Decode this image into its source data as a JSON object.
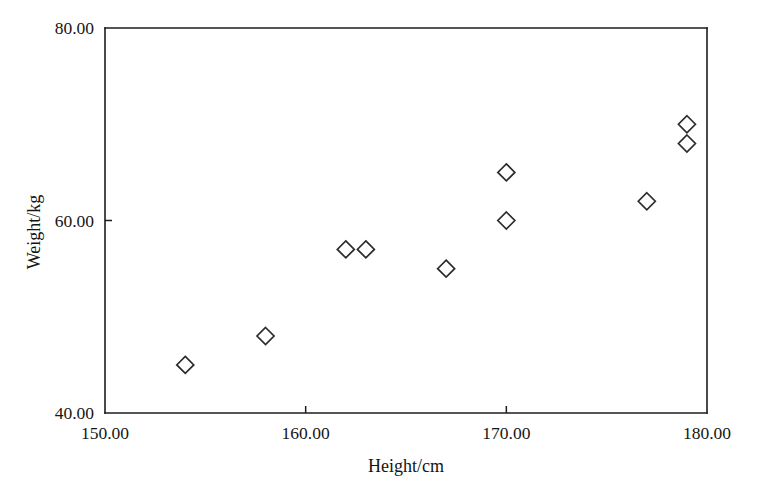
{
  "chart_data": {
    "type": "scatter",
    "title": "",
    "xlabel": "Height/cm",
    "ylabel": "Weight/kg",
    "xlim": [
      150.0,
      180.0
    ],
    "ylim": [
      40.0,
      80.0
    ],
    "xticks": [
      150.0,
      160.0,
      170.0,
      180.0
    ],
    "yticks": [
      40.0,
      60.0,
      80.0
    ],
    "xticklabels": [
      "150.00",
      "160.00",
      "170.00",
      "180.00"
    ],
    "yticklabels": [
      "40.00",
      "60.00",
      "80.00"
    ],
    "grid": false,
    "legend": null,
    "marker": "open-diamond",
    "marker_color": "#2b2b2b",
    "background": "#ffffff",
    "series": [
      {
        "name": "observations",
        "x": [
          154.0,
          158.0,
          162.0,
          163.0,
          167.0,
          170.0,
          170.0,
          177.0,
          179.0,
          179.0
        ],
        "y": [
          45.0,
          48.0,
          57.0,
          57.0,
          55.0,
          65.0,
          60.0,
          62.0,
          70.0,
          68.0
        ]
      }
    ],
    "points": [
      {
        "x": 154.0,
        "y": 45.0
      },
      {
        "x": 158.0,
        "y": 48.0
      },
      {
        "x": 162.0,
        "y": 57.0
      },
      {
        "x": 163.0,
        "y": 57.0
      },
      {
        "x": 167.0,
        "y": 55.0
      },
      {
        "x": 170.0,
        "y": 65.0
      },
      {
        "x": 170.0,
        "y": 60.0
      },
      {
        "x": 177.0,
        "y": 62.0
      },
      {
        "x": 179.0,
        "y": 70.0
      },
      {
        "x": 179.0,
        "y": 68.0
      }
    ]
  },
  "layout": {
    "plot_left": 105,
    "plot_right": 707,
    "plot_top": 28,
    "plot_bottom": 413,
    "tick_len": 7,
    "marker_half": 8.5
  }
}
